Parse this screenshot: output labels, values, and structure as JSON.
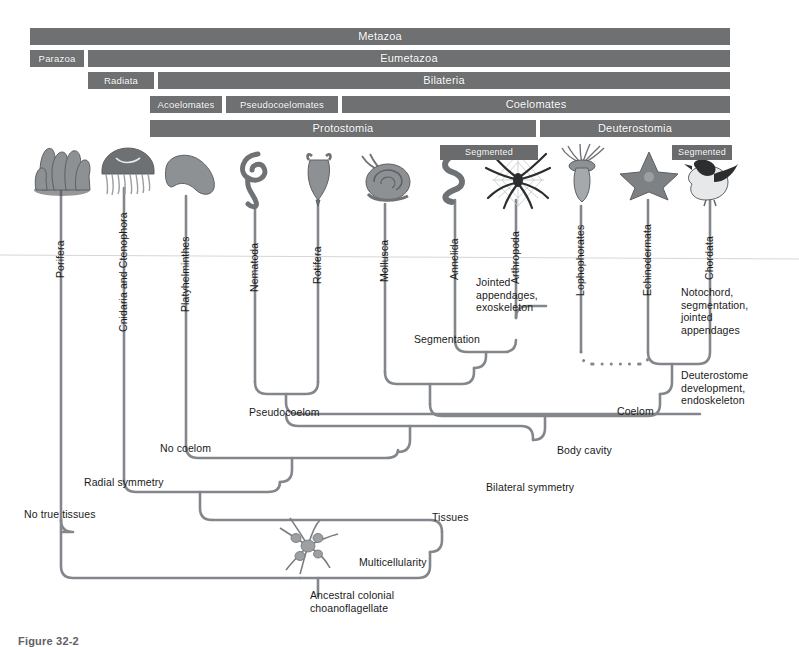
{
  "figure": {
    "caption_fragment": "Figure 32-2",
    "accent_bar_color": "#6f7072",
    "line_color": "#7b7f83",
    "text_color": "#1a1a1a"
  },
  "clade_bars": [
    {
      "label": "Metazoa",
      "x": 30,
      "y": 28,
      "w": 700,
      "h": 17,
      "size": "normal"
    },
    {
      "label": "Parazoa",
      "x": 30,
      "y": 50,
      "w": 54,
      "h": 17,
      "size": "small"
    },
    {
      "label": "Eumetazoa",
      "x": 88,
      "y": 50,
      "w": 642,
      "h": 17,
      "size": "normal"
    },
    {
      "label": "Radiata",
      "x": 88,
      "y": 72,
      "w": 66,
      "h": 17,
      "size": "small"
    },
    {
      "label": "Bilateria",
      "x": 158,
      "y": 72,
      "w": 572,
      "h": 17,
      "size": "normal"
    },
    {
      "label": "Acoelomates",
      "x": 150,
      "y": 96,
      "w": 72,
      "h": 17,
      "size": "small"
    },
    {
      "label": "Pseudocoelomates",
      "x": 226,
      "y": 96,
      "w": 112,
      "h": 17,
      "size": "small"
    },
    {
      "label": "Coelomates",
      "x": 342,
      "y": 96,
      "w": 388,
      "h": 17,
      "size": "normal"
    },
    {
      "label": "Protostomia",
      "x": 150,
      "y": 120,
      "w": 386,
      "h": 17,
      "size": "normal"
    },
    {
      "label": "Deuterostomia",
      "x": 540,
      "y": 120,
      "w": 190,
      "h": 17,
      "size": "normal"
    }
  ],
  "segmented_bars": [
    {
      "label": "Segmented",
      "x": 440,
      "y": 145,
      "w": 98,
      "h": 15
    },
    {
      "label": "Segmented",
      "x": 672,
      "y": 145,
      "w": 60,
      "h": 15
    }
  ],
  "taxa": [
    {
      "name": "Porifera",
      "stem_x": 61,
      "label_y": 266,
      "stem_top": 186,
      "stem_bottom": 520
    },
    {
      "name": "Cnidaria and Ctenophora",
      "stem_x": 124,
      "label_y": 320,
      "stem_top": 188,
      "stem_bottom": 480
    },
    {
      "name": "Platyhelminthes",
      "stem_x": 186,
      "label_y": 300,
      "stem_top": 196,
      "stem_bottom": 446
    },
    {
      "name": "Nematoda",
      "stem_x": 255,
      "label_y": 280,
      "stem_top": 205,
      "stem_bottom": 382
    },
    {
      "name": "Rotifera",
      "stem_x": 318,
      "label_y": 272,
      "stem_top": 202,
      "stem_bottom": 382
    },
    {
      "name": "Mollusca",
      "stem_x": 385,
      "label_y": 270,
      "stem_top": 204,
      "stem_bottom": 372
    },
    {
      "name": "Annelida",
      "stem_x": 455,
      "label_y": 268,
      "stem_top": 200,
      "stem_bottom": 340
    },
    {
      "name": "Arthropoda",
      "stem_x": 516,
      "label_y": 272,
      "stem_top": 200,
      "stem_bottom": 318
    },
    {
      "name": "Lophophorates",
      "stem_x": 581,
      "label_y": 284,
      "stem_top": 206,
      "stem_bottom": 352
    },
    {
      "name": "Echinodermata",
      "stem_x": 648,
      "label_y": 284,
      "stem_top": 200,
      "stem_bottom": 352
    },
    {
      "name": "Chordata",
      "stem_x": 710,
      "label_y": 268,
      "stem_top": 200,
      "stem_bottom": 330
    }
  ],
  "annotations": [
    {
      "id": "jointed-appendages",
      "text": "Jointed\nappendages,\nexoskeleton",
      "x": 476,
      "y": 276
    },
    {
      "id": "segmentation",
      "text": "Segmentation",
      "x": 414,
      "y": 333
    },
    {
      "id": "notochord",
      "text": "Notochord,\nsegmentation,\njointed\nappendages",
      "x": 681,
      "y": 286
    },
    {
      "id": "deuterostome",
      "text": "Deuterostome\ndevelopment,\nendoskeleton",
      "x": 681,
      "y": 369
    },
    {
      "id": "pseudocoelom",
      "text": "Pseudocoelom",
      "x": 249,
      "y": 406
    },
    {
      "id": "coelom",
      "text": "Coelom",
      "x": 617,
      "y": 405
    },
    {
      "id": "no-coelom",
      "text": "No coelom",
      "x": 160,
      "y": 442
    },
    {
      "id": "body-cavity",
      "text": "Body cavity",
      "x": 557,
      "y": 444
    },
    {
      "id": "radial-symmetry",
      "text": "Radial symmetry",
      "x": 84,
      "y": 476
    },
    {
      "id": "bilateral-symmetry",
      "text": "Bilateral symmetry",
      "x": 486,
      "y": 481
    },
    {
      "id": "no-true-tissues",
      "text": "No true tissues",
      "x": 24,
      "y": 508
    },
    {
      "id": "tissues",
      "text": "Tissues",
      "x": 432,
      "y": 511
    },
    {
      "id": "multicellularity",
      "text": "Multicellularity",
      "x": 359,
      "y": 556
    },
    {
      "id": "ancestral-root",
      "text": "Ancestral colonial\nchoanoflagellate",
      "x": 310,
      "y": 589
    }
  ],
  "organisms": [
    {
      "taxon": "Porifera",
      "kind": "sponge",
      "x": 32,
      "y": 146,
      "w": 62,
      "h": 46
    },
    {
      "taxon": "Cnidaria and Ctenophora",
      "kind": "jellyfish",
      "x": 98,
      "y": 146,
      "w": 58,
      "h": 48
    },
    {
      "taxon": "Platyhelminthes",
      "kind": "flatworm",
      "x": 162,
      "y": 152,
      "w": 56,
      "h": 44
    },
    {
      "taxon": "Nematoda",
      "kind": "roundworm",
      "x": 234,
      "y": 148,
      "w": 48,
      "h": 60
    },
    {
      "taxon": "Rotifera",
      "kind": "rotifer",
      "x": 304,
      "y": 150,
      "w": 30,
      "h": 54
    },
    {
      "taxon": "Mollusca",
      "kind": "snail",
      "x": 356,
      "y": 152,
      "w": 56,
      "h": 50
    },
    {
      "taxon": "Annelida",
      "kind": "earthworm",
      "x": 430,
      "y": 152,
      "w": 46,
      "h": 50
    },
    {
      "taxon": "Arthropoda",
      "kind": "spider",
      "x": 482,
      "y": 150,
      "w": 72,
      "h": 60
    },
    {
      "taxon": "Lophophorates",
      "kind": "lophophore",
      "x": 560,
      "y": 148,
      "w": 46,
      "h": 56
    },
    {
      "taxon": "Echinodermata",
      "kind": "seastar",
      "x": 620,
      "y": 150,
      "w": 58,
      "h": 52
    },
    {
      "taxon": "Chordata",
      "kind": "bird",
      "x": 684,
      "y": 158,
      "w": 54,
      "h": 46
    },
    {
      "taxon": "Ancestral",
      "kind": "choanoflagellate",
      "x": 278,
      "y": 518,
      "w": 62,
      "h": 58
    }
  ],
  "tree_nodes": {
    "multicellularity_y": 578,
    "tissues_y": 533,
    "bilateral_symmetry_y": 500,
    "radial_symmetry_y": 480,
    "body_cavity_y": 462,
    "no_coelom_y": 446,
    "pseudocoelom_y": 392,
    "coelom_y": 425,
    "segmentation_y": 356,
    "deuterostome_y": 360,
    "root_x": 310
  }
}
